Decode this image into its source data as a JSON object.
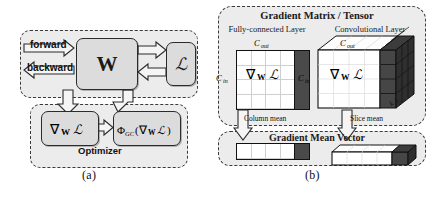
{
  "figure": {
    "caption_a": "(a)",
    "caption_b": "(b)"
  },
  "panel_a": {
    "name": "training-loop",
    "forward_label": "forward",
    "backward_label": "backward",
    "weight_box": "W",
    "loss_box": "ℒ",
    "gradient_box": "∇ᴡℒ",
    "gc_box": "Φ_GC(∇ᴡℒ)",
    "optimizer_label": "Optimizer"
  },
  "panel_b": {
    "name": "gradient-matrix-tensor",
    "title": "Gradient Matrix / Tensor",
    "fc_layer_title": "Fully-connected Layer",
    "conv_layer_title": "Convolutional Layer",
    "fc_cout_label": "C_out",
    "fc_cin_label": "C_in",
    "fc_gradient_label": "∇ᴡℒ",
    "conv_cout_label": "C_out",
    "conv_cin_label": "C_in",
    "conv_gradient_label": "∇ᴡℒ",
    "kernel_label": "k₁k₂",
    "column_mean_label": "Column mean",
    "slice_mean_label": "Slice mean",
    "mean_vector_title": "Gradient Mean Vector"
  },
  "colors": {
    "dark_cell": "#4a4a4a",
    "box_fill": "#dcdcdc",
    "group_fill": "#ececec",
    "outline": "#1a1a1a",
    "arrow_fill": "#f2f2f2"
  }
}
